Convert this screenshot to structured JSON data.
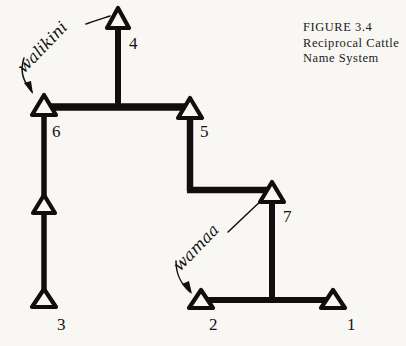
{
  "figure": {
    "caption_lines": [
      "FIGURE  3.4",
      "Reciprocal  Cattle",
      "Name  System"
    ],
    "ink_color": "#100f0e",
    "paper_color": "#f8f7f3"
  },
  "diagram": {
    "type": "kinship-name-diagram",
    "nodes": [
      {
        "id": "n4",
        "label": "4",
        "x": 118,
        "y": 22,
        "label_x": 129,
        "label_y": 49
      },
      {
        "id": "n6",
        "label": "6",
        "x": 44,
        "y": 107,
        "label_x": 52,
        "label_y": 137
      },
      {
        "id": "n5",
        "label": "5",
        "x": 190,
        "y": 110,
        "label_x": 200,
        "label_y": 137
      },
      {
        "id": "n7",
        "label": "7",
        "x": 272,
        "y": 194,
        "label_x": 283,
        "label_y": 222
      },
      {
        "id": "nmid",
        "label": "",
        "x": 44,
        "y": 206,
        "label_x": 0,
        "label_y": 0
      },
      {
        "id": "n3",
        "label": "3",
        "x": 44,
        "y": 299,
        "label_x": 57,
        "label_y": 330
      },
      {
        "id": "n2",
        "label": "2",
        "x": 201,
        "y": 300,
        "label_x": 209,
        "label_y": 330
      },
      {
        "id": "n1",
        "label": "1",
        "x": 333,
        "y": 300,
        "label_x": 347,
        "label_y": 330
      }
    ],
    "annotations": [
      {
        "id": "walikini",
        "text": "walikini",
        "points_to": [
          "n4",
          "n6"
        ]
      },
      {
        "id": "wamaa",
        "text": "wamaa",
        "points_to": [
          "n7",
          "n2"
        ]
      }
    ]
  }
}
